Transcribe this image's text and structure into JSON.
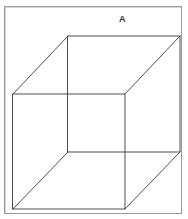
{
  "figure": {
    "label": "A",
    "colors": {
      "line": "#3a3a3a",
      "frame": "#9a9a9a",
      "label": "#333333",
      "background": "#ffffff"
    },
    "vertices": {
      "front_top_left": [
        13,
        94
      ],
      "front_top_right": [
        125,
        94
      ],
      "front_bottom_left": [
        13,
        209
      ],
      "front_bottom_right": [
        125,
        209
      ],
      "back_top_left": [
        68,
        36
      ],
      "back_top_right": [
        180,
        36
      ],
      "back_bottom_left": [
        68,
        152
      ],
      "back_bottom_right": [
        180,
        152
      ]
    }
  }
}
